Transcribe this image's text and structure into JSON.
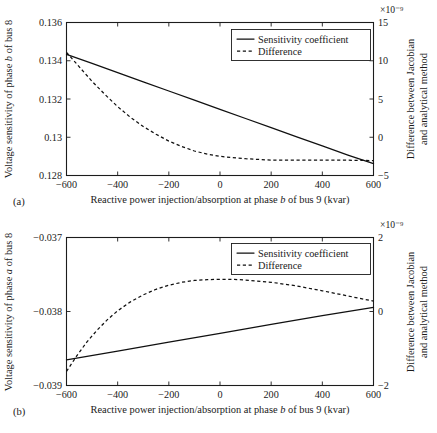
{
  "figure": {
    "panels": [
      {
        "tag": "(a)",
        "xlabel_parts": [
          "Reactive power injection/absorption at phase ",
          "b",
          " of bus 9 (kvar)"
        ],
        "ylabel_left_parts": [
          "Voltage sensitivity of phase ",
          "b",
          " of bus 8"
        ],
        "ylabel_right_line1": "Difference between Jacobian",
        "ylabel_right_line2": "and analytical method",
        "exponent": "×10⁻⁹",
        "legend": [
          "Sensitivity coefficient",
          "Difference"
        ]
      },
      {
        "tag": "(b)",
        "xlabel_parts": [
          "Reactive power injection/absorption at phase ",
          "b",
          " of bus 9 (kvar)"
        ],
        "ylabel_left_parts": [
          "Voltage sensitivity of phase ",
          "a",
          " of bus 8"
        ],
        "ylabel_right_line1": "Difference between Jacobian",
        "ylabel_right_line2": "and analytical method",
        "exponent": "×10⁻⁹",
        "legend": [
          "Sensitivity coefficient",
          "Difference"
        ]
      }
    ]
  },
  "chart_data": [
    {
      "type": "line",
      "panel": "(a)",
      "title": "",
      "xlabel": "Reactive power injection/absorption at phase b of bus 9 (kvar)",
      "ylabel": "Voltage sensitivity of phase b of bus 8",
      "y2label": "Difference between Jacobian and analytical method",
      "y2_exponent": "×10⁻⁹",
      "xlim": [
        -600,
        600
      ],
      "ylim": [
        0.128,
        0.136
      ],
      "y2lim": [
        -5,
        15
      ],
      "xticks": [
        -600,
        -400,
        -200,
        0,
        200,
        400,
        600
      ],
      "yticks": [
        0.128,
        0.13,
        0.132,
        0.134,
        0.136
      ],
      "y2ticks": [
        -5,
        0,
        5,
        10,
        15
      ],
      "grid": false,
      "legend_position": "top-right",
      "series": [
        {
          "name": "Sensitivity coefficient",
          "axis": "left",
          "style": "solid",
          "x": [
            -600,
            -500,
            -400,
            -300,
            -200,
            -100,
            0,
            100,
            200,
            300,
            400,
            500,
            600
          ],
          "values": [
            0.13433,
            0.13386,
            0.13338,
            0.1329,
            0.13242,
            0.13194,
            0.13146,
            0.13098,
            0.1305,
            0.13002,
            0.12955,
            0.12907,
            0.12862
          ]
        },
        {
          "name": "Difference",
          "axis": "right",
          "style": "dashed",
          "x": [
            -600,
            -550,
            -500,
            -450,
            -400,
            -350,
            -300,
            -250,
            -200,
            -150,
            -100,
            -50,
            0,
            100,
            200,
            300,
            400,
            500,
            600
          ],
          "values": [
            11.1,
            9.2,
            7.3,
            5.6,
            4.0,
            2.6,
            1.4,
            0.4,
            -0.5,
            -1.2,
            -1.8,
            -2.2,
            -2.5,
            -2.8,
            -3.0,
            -3.0,
            -3.0,
            -3.0,
            -3.05
          ]
        }
      ]
    },
    {
      "type": "line",
      "panel": "(b)",
      "title": "",
      "xlabel": "Reactive power injection/absorption at phase b of bus 9 (kvar)",
      "ylabel": "Voltage sensitivity of phase a of bus 8",
      "y2label": "Difference between Jacobian and analytical method",
      "y2_exponent": "×10⁻⁹",
      "xlim": [
        -600,
        600
      ],
      "ylim": [
        -0.039,
        -0.037
      ],
      "y2lim": [
        -2,
        2
      ],
      "xticks": [
        -600,
        -400,
        -200,
        0,
        200,
        400,
        600
      ],
      "yticks": [
        -0.039,
        -0.038,
        -0.037
      ],
      "y2ticks": [
        -2,
        0,
        2
      ],
      "grid": false,
      "legend_position": "top-right",
      "series": [
        {
          "name": "Sensitivity coefficient",
          "axis": "left",
          "style": "solid",
          "x": [
            -600,
            -400,
            -200,
            0,
            200,
            400,
            600
          ],
          "values": [
            -0.038655,
            -0.038535,
            -0.038415,
            -0.038295,
            -0.038175,
            -0.038055,
            -0.037945
          ]
        },
        {
          "name": "Difference",
          "axis": "right",
          "style": "dashed",
          "x": [
            -600,
            -560,
            -520,
            -480,
            -440,
            -400,
            -350,
            -300,
            -250,
            -200,
            -150,
            -100,
            -50,
            0,
            50,
            100,
            200,
            300,
            400,
            500,
            600
          ],
          "values": [
            -1.62,
            -1.2,
            -0.82,
            -0.5,
            -0.22,
            0.02,
            0.26,
            0.45,
            0.6,
            0.71,
            0.79,
            0.84,
            0.86,
            0.87,
            0.87,
            0.85,
            0.79,
            0.69,
            0.56,
            0.42,
            0.28
          ]
        }
      ]
    }
  ]
}
